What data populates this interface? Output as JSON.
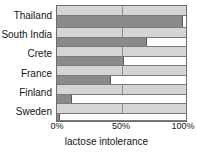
{
  "chart_data": {
    "type": "bar",
    "orientation": "horizontal",
    "title": "",
    "xlabel": "lactose intolerance",
    "ylabel": "",
    "categories": [
      "Thailand",
      "South India",
      "Crete",
      "France",
      "Finland",
      "Sweden"
    ],
    "values": [
      98,
      70,
      52,
      42,
      12,
      2
    ],
    "unit": "%",
    "xlim": [
      0,
      100
    ],
    "xticks": [
      0,
      50,
      100
    ],
    "xtick_labels": [
      "0%",
      "50%",
      "100%"
    ],
    "grid": true,
    "gridlines_at": [
      50
    ],
    "legend": null,
    "series": [
      {
        "name": "lactose intolerance",
        "values": [
          98,
          70,
          52,
          42,
          12,
          2
        ]
      }
    ],
    "colors": {
      "bar_fill": "#8a8a8a",
      "bar_remainder": "#ffffff",
      "row_band": "#d5d5d5",
      "frame": "#6e6e6e",
      "gridline": "#8d8d8d",
      "text": "#141414"
    }
  },
  "axis": {
    "x_title": "lactose intolerance",
    "ticks": [
      {
        "label": "0%",
        "value": 0
      },
      {
        "label": "50%",
        "value": 50
      },
      {
        "label": "100%",
        "value": 100
      }
    ]
  },
  "bars": [
    {
      "label": "Thailand",
      "value": 98
    },
    {
      "label": "South India",
      "value": 70
    },
    {
      "label": "Crete",
      "value": 52
    },
    {
      "label": "France",
      "value": 42
    },
    {
      "label": "Finland",
      "value": 12
    },
    {
      "label": "Sweden",
      "value": 2
    }
  ]
}
